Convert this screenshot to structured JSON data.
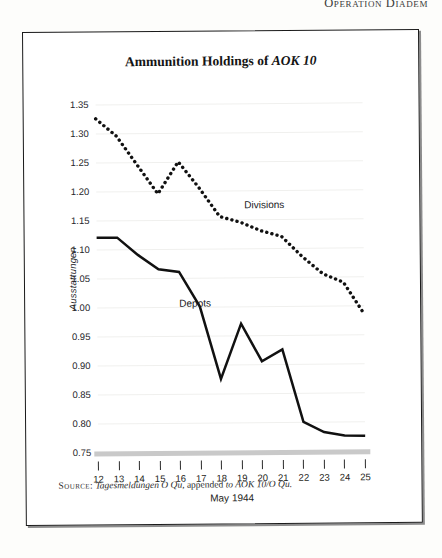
{
  "page": {
    "running_header": "Operation Diadem"
  },
  "figure": {
    "title_plain": "Ammunition Holdings of ",
    "title_italic": "AOK 10",
    "source_label": "Source:",
    "source_italic_1": "Tagesmeldungen O Qu",
    "source_plain_1": ", appended ",
    "source_italic_2": "to AOK 10/O Qu."
  },
  "chart_data": {
    "type": "line",
    "title": "Ammunition Holdings of AOK 10",
    "xlabel": "May 1944",
    "ylabel": "Ausstattungen",
    "x": [
      12,
      13,
      14,
      15,
      16,
      17,
      18,
      19,
      20,
      21,
      22,
      23,
      24,
      25
    ],
    "categories": [
      "12",
      "13",
      "14",
      "15",
      "16",
      "17",
      "18",
      "19",
      "20",
      "21",
      "22",
      "23",
      "24",
      "25"
    ],
    "xlim": [
      12,
      25
    ],
    "ylim": [
      0.75,
      1.35
    ],
    "yticks": [
      0.75,
      0.8,
      0.85,
      0.9,
      0.95,
      1.0,
      1.05,
      1.1,
      1.15,
      1.2,
      1.25,
      1.3,
      1.35
    ],
    "ytick_labels": [
      "0.75",
      "0.80",
      "0.85",
      "0.90",
      "0.95",
      "1.00",
      "1.05",
      "1.10",
      "1.15",
      "1.20",
      "1.25",
      "1.30",
      "1.35"
    ],
    "grid": true,
    "legend_position": "inline-annotation",
    "series": [
      {
        "name": "Divisions",
        "style": "dotted",
        "label_x": 19.2,
        "label_y": 1.175,
        "values": [
          1.325,
          1.295,
          1.245,
          1.195,
          1.25,
          1.205,
          1.155,
          1.145,
          1.13,
          1.12,
          1.085,
          1.055,
          1.04,
          0.985
        ]
      },
      {
        "name": "Depots",
        "style": "solid",
        "label_x": 16.0,
        "label_y": 1.005,
        "values": [
          1.12,
          1.12,
          1.09,
          1.065,
          1.06,
          1.0,
          0.875,
          0.97,
          0.905,
          0.925,
          0.8,
          0.782,
          0.776,
          0.775
        ]
      }
    ]
  }
}
